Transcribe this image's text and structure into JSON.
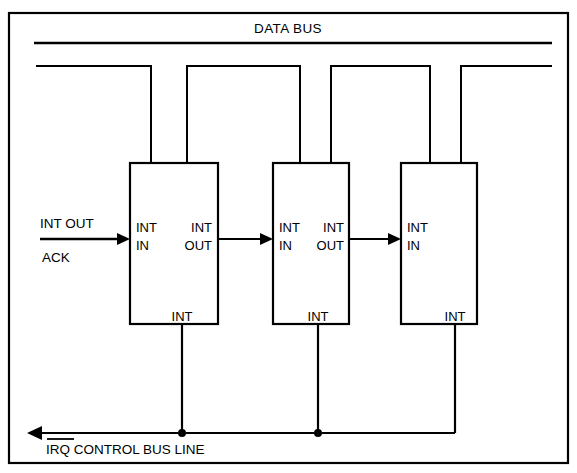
{
  "figure": {
    "kind": "daisy-chain-interrupt-diagram",
    "background_color": "#ffffff",
    "ink_color": "#000000",
    "bus_title": "DATA BUS",
    "control_bus_label": "IRQ CONTROL BUS LINE",
    "control_bus_overline_token": "IRQ",
    "input_signal_top": "INT OUT",
    "input_signal_bottom": "ACK"
  },
  "devices": [
    {
      "id": "device-1",
      "port_in_line1": "INT",
      "port_in_line2": "IN",
      "port_out_line1": "INT",
      "port_out_line2": "OUT",
      "port_bottom": "INT"
    },
    {
      "id": "device-2",
      "port_in_line1": "INT",
      "port_in_line2": "IN",
      "port_out_line1": "INT",
      "port_out_line2": "OUT",
      "port_bottom": "INT"
    },
    {
      "id": "device-3",
      "port_in_line1": "INT",
      "port_in_line2": "IN",
      "port_out_line1": "",
      "port_out_line2": "",
      "port_bottom": "INT"
    }
  ]
}
